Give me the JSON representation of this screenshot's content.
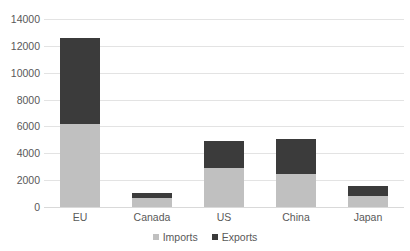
{
  "chart_data": {
    "type": "bar",
    "subtype": "stacked-vertical",
    "title": "",
    "subtitle": "",
    "xlabel": "",
    "ylabel": "",
    "categories": [
      "EU",
      "Canada",
      "US",
      "China",
      "Japan"
    ],
    "series": [
      {
        "name": "Imports",
        "color": "#c0c0c0",
        "values": [
          6200,
          700,
          2900,
          2450,
          800
        ]
      },
      {
        "name": "Exports",
        "color": "#3b3b3b",
        "values": [
          6400,
          350,
          2000,
          2650,
          800
        ]
      }
    ],
    "totals": [
      12600,
      1050,
      4900,
      5100,
      1600
    ],
    "ylim": [
      0,
      14000
    ],
    "ytick_labels": [
      "0",
      "2000",
      "4000",
      "6000",
      "8000",
      "10000",
      "12000",
      "14000"
    ],
    "ytick_values": [
      0,
      2000,
      4000,
      6000,
      8000,
      10000,
      12000,
      14000
    ],
    "grid": "horizontal",
    "legend_position": "bottom",
    "legend_entries": [
      {
        "label": "Imports",
        "swatch": "imports-swatch"
      },
      {
        "label": "Exports",
        "swatch": "exports-swatch"
      }
    ],
    "colors": {
      "imports": "#c0c0c0",
      "exports": "#3b3b3b",
      "gridline": "#e3e3e3",
      "axis_text": "#595959",
      "background": "#ffffff"
    }
  }
}
